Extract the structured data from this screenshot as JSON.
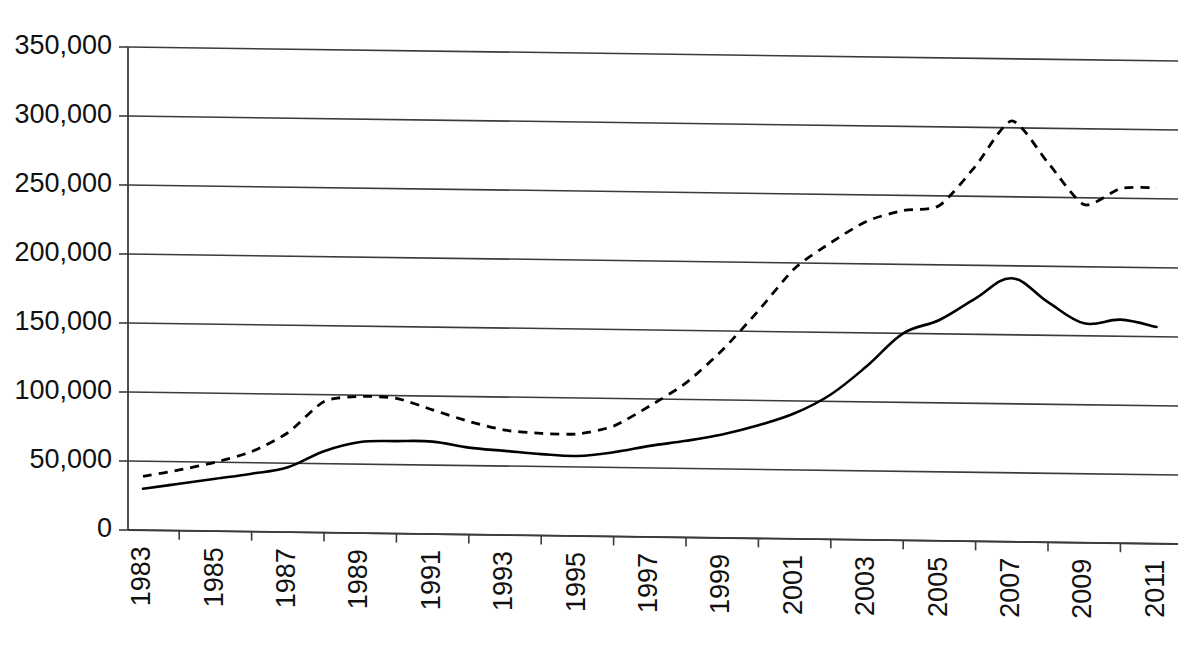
{
  "chart_data": {
    "type": "line",
    "title": "",
    "subtitle": "",
    "xlabel": "",
    "ylabel": "",
    "x": [
      1983,
      1984,
      1985,
      1986,
      1987,
      1988,
      1989,
      1990,
      1991,
      1992,
      1993,
      1994,
      1995,
      1996,
      1997,
      1998,
      1999,
      2000,
      2001,
      2002,
      2003,
      2004,
      2005,
      2006,
      2007,
      2008,
      2009,
      2010,
      2011
    ],
    "series": [
      {
        "name": "dashed-series",
        "style": "dashed",
        "color": "#000000",
        "values": [
          39000,
          44000,
          50000,
          58000,
          72000,
          95000,
          99000,
          98000,
          90000,
          82000,
          76000,
          74000,
          74000,
          80000,
          95000,
          112000,
          136000,
          165000,
          196000,
          215000,
          231000,
          239000,
          243000,
          272000,
          305000,
          275000,
          245000,
          257000,
          258000
        ]
      },
      {
        "name": "solid-series",
        "style": "solid",
        "color": "#000000",
        "values": [
          30000,
          34000,
          38000,
          42000,
          47000,
          59000,
          66000,
          67000,
          67000,
          63000,
          61000,
          59000,
          58000,
          61000,
          66000,
          70000,
          75000,
          82000,
          91000,
          105000,
          126000,
          150000,
          160000,
          176000,
          191000,
          174000,
          159000,
          162000,
          157000
        ]
      }
    ],
    "ylim": [
      0,
      350000
    ],
    "ytick_values": [
      0,
      50000,
      100000,
      150000,
      200000,
      250000,
      300000,
      350000
    ],
    "ytick_labels": [
      "0",
      "50,000",
      "100,000",
      "150,000",
      "200,000",
      "250,000",
      "300,000",
      "350,000"
    ],
    "xtick_values": [
      1983,
      1985,
      1987,
      1989,
      1991,
      1993,
      1995,
      1997,
      1999,
      2001,
      2003,
      2005,
      2007,
      2009,
      2011
    ],
    "xtick_labels": [
      "1983",
      "1985",
      "1987",
      "1989",
      "1991",
      "1993",
      "1995",
      "1997",
      "1999",
      "2001",
      "2003",
      "2005",
      "2007",
      "2009",
      "2011"
    ],
    "xtick_label_rotation": -90,
    "grid": {
      "horizontal": true,
      "vertical": false,
      "color": "#3b3b3b"
    },
    "legend": {
      "visible": false,
      "position": "none",
      "entries": []
    },
    "background": "#ffffff",
    "annotations": []
  },
  "plot_geometry": {
    "left": 128,
    "right": 1178,
    "top": 47,
    "bottom": 530,
    "first_label_x": 143,
    "year_step_px": 36.2
  }
}
